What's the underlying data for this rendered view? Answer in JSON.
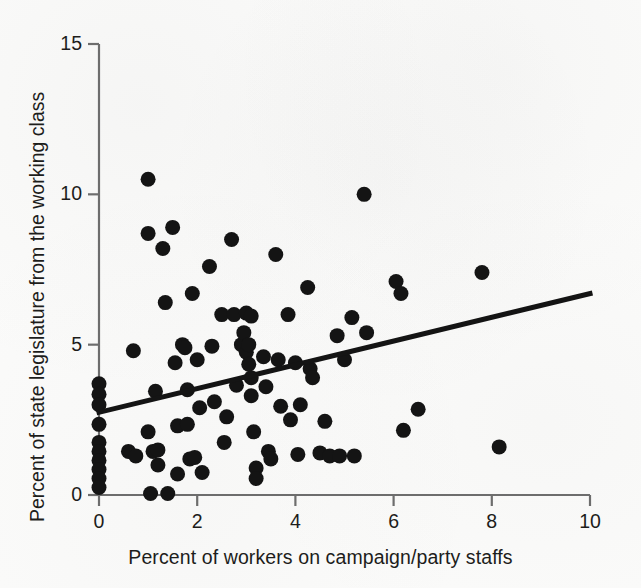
{
  "figure": {
    "background_color": "#fbfbfa",
    "ink_color": "#141414",
    "axis_color": "#6d6d6d"
  },
  "chart_data": {
    "type": "scatter",
    "title": "",
    "subtitle": "",
    "xlabel": "Percent of workers on campaign/party staffs",
    "ylabel": "Percent of state legislature from the working class",
    "xlim": [
      0,
      10
    ],
    "ylim": [
      0,
      15
    ],
    "xticks": [
      0,
      2,
      4,
      6,
      8,
      10
    ],
    "yticks": [
      0,
      5,
      10,
      15
    ],
    "xtick_labels": [
      "0",
      "2",
      "4",
      "6",
      "8",
      "10"
    ],
    "ytick_labels": [
      "0",
      "5",
      "10",
      "15"
    ],
    "grid": false,
    "legend": null,
    "marker": {
      "shape": "circle",
      "color": "#141414",
      "size_px": 15
    },
    "trendline": {
      "type": "linear-fit",
      "color": "#141414",
      "width_px": 5,
      "x_start": 0,
      "y_start": 2.75,
      "x_end": 10,
      "y_end": 6.7,
      "slope": 0.395,
      "intercept": 2.75
    },
    "points": [
      [
        0.0,
        3.7
      ],
      [
        0.0,
        3.35
      ],
      [
        0.0,
        3.0
      ],
      [
        0.0,
        2.35
      ],
      [
        0.0,
        1.75
      ],
      [
        0.0,
        1.45
      ],
      [
        0.0,
        1.15
      ],
      [
        0.0,
        0.85
      ],
      [
        0.0,
        0.55
      ],
      [
        0.0,
        0.25
      ],
      [
        0.6,
        1.45
      ],
      [
        0.7,
        4.8
      ],
      [
        0.75,
        1.3
      ],
      [
        1.0,
        10.5
      ],
      [
        1.0,
        8.7
      ],
      [
        1.0,
        2.1
      ],
      [
        1.05,
        0.05
      ],
      [
        1.1,
        1.45
      ],
      [
        1.15,
        3.45
      ],
      [
        1.2,
        1.5
      ],
      [
        1.2,
        1.0
      ],
      [
        1.3,
        8.2
      ],
      [
        1.35,
        6.4
      ],
      [
        1.4,
        0.05
      ],
      [
        1.5,
        8.9
      ],
      [
        1.55,
        4.4
      ],
      [
        1.6,
        2.3
      ],
      [
        1.6,
        0.7
      ],
      [
        1.7,
        5.0
      ],
      [
        1.75,
        4.9
      ],
      [
        1.8,
        3.5
      ],
      [
        1.8,
        2.35
      ],
      [
        1.85,
        1.2
      ],
      [
        1.9,
        6.7
      ],
      [
        1.95,
        1.25
      ],
      [
        2.0,
        4.5
      ],
      [
        2.05,
        2.9
      ],
      [
        2.1,
        0.75
      ],
      [
        2.25,
        7.6
      ],
      [
        2.3,
        4.95
      ],
      [
        2.35,
        3.1
      ],
      [
        2.5,
        6.0
      ],
      [
        2.55,
        1.75
      ],
      [
        2.6,
        2.6
      ],
      [
        2.7,
        8.5
      ],
      [
        2.75,
        6.0
      ],
      [
        2.8,
        3.65
      ],
      [
        2.9,
        5.0
      ],
      [
        2.95,
        5.4
      ],
      [
        3.0,
        6.05
      ],
      [
        3.0,
        4.75
      ],
      [
        3.05,
        5.0
      ],
      [
        3.05,
        4.35
      ],
      [
        3.1,
        5.95
      ],
      [
        3.1,
        3.9
      ],
      [
        3.1,
        3.3
      ],
      [
        3.15,
        2.1
      ],
      [
        3.2,
        0.9
      ],
      [
        3.2,
        0.55
      ],
      [
        3.35,
        4.6
      ],
      [
        3.4,
        3.6
      ],
      [
        3.45,
        1.45
      ],
      [
        3.5,
        1.2
      ],
      [
        3.6,
        8.0
      ],
      [
        3.65,
        4.5
      ],
      [
        3.7,
        2.95
      ],
      [
        3.85,
        6.0
      ],
      [
        3.9,
        2.5
      ],
      [
        4.0,
        4.4
      ],
      [
        4.05,
        1.35
      ],
      [
        4.1,
        3.0
      ],
      [
        4.25,
        6.9
      ],
      [
        4.3,
        4.2
      ],
      [
        4.35,
        3.9
      ],
      [
        4.5,
        1.4
      ],
      [
        4.6,
        2.45
      ],
      [
        4.7,
        1.3
      ],
      [
        4.85,
        5.3
      ],
      [
        4.9,
        1.3
      ],
      [
        5.0,
        4.5
      ],
      [
        5.15,
        5.9
      ],
      [
        5.2,
        1.3
      ],
      [
        5.4,
        10.0
      ],
      [
        5.45,
        5.4
      ],
      [
        6.05,
        7.1
      ],
      [
        6.15,
        6.7
      ],
      [
        6.2,
        2.15
      ],
      [
        6.5,
        2.85
      ],
      [
        7.8,
        7.4
      ],
      [
        8.15,
        1.6
      ]
    ]
  }
}
